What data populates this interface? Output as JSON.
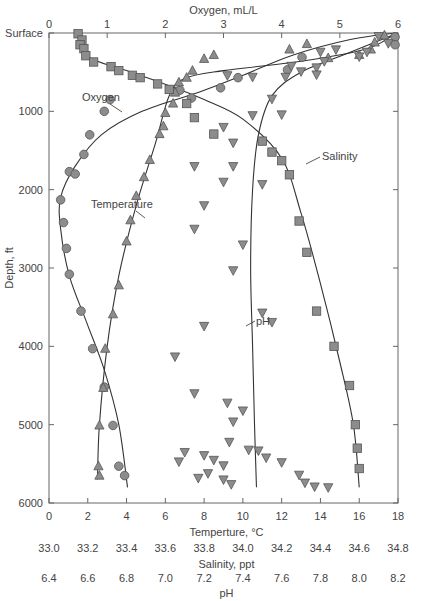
{
  "chart_data": {
    "type": "scatter",
    "title": "",
    "top_axis": {
      "label": "Oxygen, mL/L",
      "ticks": [
        "0",
        "1",
        "2",
        "3",
        "4",
        "5",
        "6"
      ],
      "range": [
        0,
        6
      ]
    },
    "y_axis": {
      "label": "Depth, ft",
      "ticks": [
        "Surface",
        "1000",
        "2000",
        "3000",
        "4000",
        "5000",
        "6000"
      ],
      "range": [
        0,
        6000
      ],
      "inverted": true
    },
    "bottom_axes": [
      {
        "label": "Temperture, °C",
        "ticks": [
          "0",
          "2",
          "4",
          "6",
          "8",
          "10",
          "12",
          "14",
          "16",
          "18"
        ],
        "range": [
          0,
          18
        ]
      },
      {
        "label": "Salinity, ppt",
        "ticks": [
          "33.0",
          "33.2",
          "33.4",
          "33.6",
          "33.8",
          "34.0",
          "34.2",
          "34.4",
          "34.6",
          "34.8"
        ],
        "range": [
          33.0,
          34.8
        ]
      },
      {
        "label": "pH",
        "ticks": [
          "6.4",
          "6.6",
          "6.8",
          "7.0",
          "7.2",
          "7.4",
          "7.6",
          "7.8",
          "8.0",
          "8.2"
        ],
        "range": [
          6.4,
          8.2
        ]
      }
    ],
    "grid": false,
    "series": [
      {
        "name": "Oxygen",
        "marker": "circle",
        "axis": "oxygen",
        "points": [
          [
            5.95,
            50
          ],
          [
            5.95,
            150
          ],
          [
            4.35,
            310
          ],
          [
            4.1,
            470
          ],
          [
            3.25,
            570
          ],
          [
            2.95,
            700
          ],
          [
            2.45,
            830
          ],
          [
            2.25,
            730
          ],
          [
            1.05,
            850
          ],
          [
            0.95,
            1000
          ],
          [
            0.7,
            1300
          ],
          [
            0.6,
            1550
          ],
          [
            0.35,
            1770
          ],
          [
            0.45,
            1800
          ],
          [
            0.2,
            2130
          ],
          [
            0.25,
            2420
          ],
          [
            0.3,
            2750
          ],
          [
            0.35,
            3080
          ],
          [
            0.55,
            3550
          ],
          [
            0.75,
            4030
          ],
          [
            0.95,
            4520
          ],
          [
            1.1,
            5010
          ],
          [
            1.2,
            5530
          ],
          [
            1.3,
            5650
          ]
        ],
        "curve": [
          [
            5.95,
            0
          ],
          [
            5.2,
            80
          ],
          [
            4.2,
            280
          ],
          [
            3.3,
            550
          ],
          [
            2.6,
            750
          ],
          [
            1.6,
            1000
          ],
          [
            0.9,
            1300
          ],
          [
            0.45,
            1700
          ],
          [
            0.2,
            2100
          ],
          [
            0.2,
            2500
          ],
          [
            0.35,
            3100
          ],
          [
            0.65,
            3700
          ],
          [
            0.95,
            4300
          ],
          [
            1.2,
            5000
          ],
          [
            1.35,
            5800
          ]
        ]
      },
      {
        "name": "Temperature",
        "marker": "triangle-up",
        "axis": "temperature",
        "points": [
          [
            17.3,
            30
          ],
          [
            16.8,
            120
          ],
          [
            16.6,
            210
          ],
          [
            16.0,
            280
          ],
          [
            14.4,
            320
          ],
          [
            13.3,
            140
          ],
          [
            12.4,
            210
          ],
          [
            8.5,
            280
          ],
          [
            8.0,
            330
          ],
          [
            7.4,
            480
          ],
          [
            7.1,
            570
          ],
          [
            6.7,
            630
          ],
          [
            6.5,
            760
          ],
          [
            6.4,
            900
          ],
          [
            6.0,
            1020
          ],
          [
            5.9,
            1190
          ],
          [
            5.7,
            1290
          ],
          [
            5.2,
            1620
          ],
          [
            4.9,
            1840
          ],
          [
            4.5,
            2080
          ],
          [
            4.2,
            2390
          ],
          [
            4.0,
            2660
          ],
          [
            3.6,
            3220
          ],
          [
            3.3,
            3590
          ],
          [
            2.9,
            4030
          ],
          [
            2.8,
            4530
          ],
          [
            2.6,
            5010
          ],
          [
            2.55,
            5530
          ],
          [
            2.6,
            5650
          ]
        ],
        "curve": [
          [
            17.9,
            0
          ],
          [
            16.4,
            200
          ],
          [
            13.0,
            360
          ],
          [
            9.0,
            480
          ],
          [
            7.0,
            580
          ],
          [
            6.2,
            800
          ],
          [
            5.5,
            1400
          ],
          [
            4.5,
            2200
          ],
          [
            3.6,
            3100
          ],
          [
            3.0,
            4000
          ],
          [
            2.6,
            5000
          ],
          [
            2.5,
            5700
          ]
        ]
      },
      {
        "name": "Salinity",
        "marker": "square",
        "axis": "salinity",
        "points": [
          [
            33.15,
            10
          ],
          [
            33.17,
            90
          ],
          [
            33.16,
            150
          ],
          [
            33.18,
            200
          ],
          [
            33.19,
            290
          ],
          [
            33.23,
            370
          ],
          [
            33.32,
            430
          ],
          [
            33.36,
            480
          ],
          [
            33.43,
            540
          ],
          [
            33.47,
            570
          ],
          [
            33.56,
            650
          ],
          [
            33.62,
            720
          ],
          [
            33.71,
            900
          ],
          [
            33.75,
            1080
          ],
          [
            33.85,
            1290
          ],
          [
            34.1,
            1380
          ],
          [
            34.15,
            1520
          ],
          [
            34.2,
            1630
          ],
          [
            34.24,
            1810
          ],
          [
            34.29,
            2400
          ],
          [
            34.33,
            2800
          ],
          [
            34.38,
            3550
          ],
          [
            34.47,
            4000
          ],
          [
            34.55,
            4500
          ],
          [
            34.58,
            5000
          ],
          [
            34.59,
            5300
          ],
          [
            34.6,
            5560
          ]
        ],
        "curve": [
          [
            33.15,
            0
          ],
          [
            33.2,
            300
          ],
          [
            33.4,
            480
          ],
          [
            33.65,
            700
          ],
          [
            33.8,
            850
          ],
          [
            34.0,
            1100
          ],
          [
            34.2,
            1600
          ],
          [
            34.3,
            2300
          ],
          [
            34.4,
            3200
          ],
          [
            34.5,
            4200
          ],
          [
            34.57,
            5000
          ],
          [
            34.6,
            5800
          ]
        ]
      },
      {
        "name": "pH",
        "marker": "triangle-down",
        "axis": "ph",
        "points": [
          [
            8.1,
            40
          ],
          [
            8.15,
            130
          ],
          [
            8.04,
            240
          ],
          [
            7.88,
            210
          ],
          [
            7.82,
            360
          ],
          [
            7.78,
            440
          ],
          [
            7.78,
            530
          ],
          [
            7.7,
            490
          ],
          [
            7.65,
            420
          ],
          [
            7.62,
            560
          ],
          [
            7.45,
            560
          ],
          [
            7.8,
            240
          ],
          [
            8.0,
            300
          ],
          [
            7.32,
            540
          ],
          [
            7.55,
            840
          ],
          [
            7.45,
            1050
          ],
          [
            7.6,
            1040
          ],
          [
            7.3,
            1200
          ],
          [
            7.35,
            1400
          ],
          [
            7.35,
            1700
          ],
          [
            7.15,
            1700
          ],
          [
            7.3,
            1900
          ],
          [
            7.5,
            1930
          ],
          [
            7.2,
            2200
          ],
          [
            7.15,
            2500
          ],
          [
            7.4,
            2700
          ],
          [
            7.35,
            3030
          ],
          [
            7.2,
            3740
          ],
          [
            7.5,
            3570
          ],
          [
            7.55,
            3690
          ],
          [
            7.05,
            4130
          ],
          [
            7.15,
            4600
          ],
          [
            7.32,
            4720
          ],
          [
            7.4,
            4820
          ],
          [
            7.35,
            4960
          ],
          [
            7.33,
            5220
          ],
          [
            7.43,
            5320
          ],
          [
            7.48,
            5330
          ],
          [
            7.52,
            5420
          ],
          [
            7.1,
            5350
          ],
          [
            7.07,
            5470
          ],
          [
            7.2,
            5390
          ],
          [
            7.25,
            5450
          ],
          [
            7.3,
            5520
          ],
          [
            7.22,
            5620
          ],
          [
            7.17,
            5680
          ],
          [
            7.3,
            5700
          ],
          [
            7.34,
            5760
          ],
          [
            7.69,
            5640
          ],
          [
            7.72,
            5740
          ],
          [
            7.77,
            5790
          ],
          [
            7.84,
            5800
          ],
          [
            7.6,
            5480
          ]
        ],
        "curve": [
          [
            8.2,
            0
          ],
          [
            7.95,
            250
          ],
          [
            7.7,
            500
          ],
          [
            7.55,
            800
          ],
          [
            7.48,
            1300
          ],
          [
            7.45,
            2000
          ],
          [
            7.44,
            3000
          ],
          [
            7.45,
            4000
          ],
          [
            7.46,
            5000
          ],
          [
            7.47,
            5800
          ]
        ]
      }
    ],
    "annotations": [
      {
        "text": "Oxygen",
        "near_series": "Oxygen"
      },
      {
        "text": "Temperature",
        "near_series": "Temperature"
      },
      {
        "text": "Salinity",
        "near_series": "Salinity"
      },
      {
        "text": "pH",
        "near_series": "pH"
      }
    ],
    "colors": {
      "marker_fill": "#8c8c8c",
      "marker_stroke": "#555555",
      "line": "#333333",
      "axis": "#666666"
    }
  }
}
